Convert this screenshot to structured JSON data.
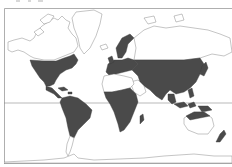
{
  "map": {
    "title": "",
    "type": "world distribution map",
    "projection": "mercator",
    "colors": {
      "shaded": "#4a4a4a",
      "land_outline": "#8a8a8a",
      "background": "#ffffff",
      "frame": "#9a9a9a"
    },
    "reference_lines": [
      {
        "name": "equator"
      }
    ],
    "regions": {
      "shaded": [
        "North America (USA, southern Canada, Mexico)",
        "Central America & Caribbean",
        "South America (except southern tip)",
        "Europe",
        "Asia (Siberia to India, China, Japan)",
        "Sub-Saharan Africa",
        "Madagascar",
        "Southeast Asia & Indonesia",
        "New Guinea",
        "Northern Australia",
        "New Zealand"
      ],
      "unshaded": [
        "Arctic Canada",
        "Alaska",
        "Greenland",
        "Arctic Russia",
        "Sahara",
        "Arabian Peninsula",
        "Southern Australia",
        "Patagonia",
        "Antarctica"
      ]
    }
  }
}
